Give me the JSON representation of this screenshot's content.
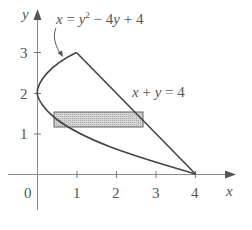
{
  "figure": {
    "type": "region-between-curves",
    "curves": [
      {
        "label": "x = y² − 4y + 4",
        "equation": "x = y^2 - 4y + 4"
      },
      {
        "label": "x + y = 4",
        "equation": "x + y = 4"
      }
    ],
    "axes": {
      "x_label": "x",
      "y_label": "y",
      "origin_label": "0",
      "x_ticks": [
        "1",
        "2",
        "3",
        "4"
      ],
      "y_ticks": [
        "1",
        "2",
        "3"
      ]
    },
    "label_parabola": {
      "lhs": "x",
      "eq": " = ",
      "y": "y",
      "sup": "2",
      "rest": " − 4",
      "y2": "y",
      "tail": " + 4"
    },
    "label_line": {
      "x": "x",
      "plus": " + ",
      "y": "y",
      "tail": " = 4"
    },
    "strip": {
      "x_from": 0.44,
      "x_to": 2.68,
      "y_from": 1.16,
      "y_to": 1.53,
      "fill": "#cfcfcf"
    },
    "colors": {
      "curve": "#444444",
      "axis": "#777777",
      "text": "#555555"
    }
  }
}
